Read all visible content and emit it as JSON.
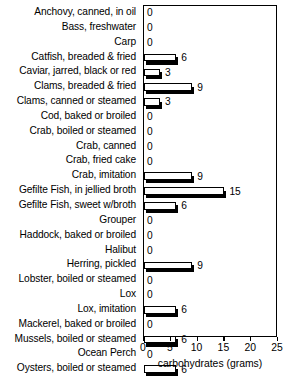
{
  "chart_data": {
    "type": "bar",
    "orientation": "horizontal",
    "title": "",
    "xlabel": "carbohydrates (grams)",
    "ylabel": "",
    "xlim": [
      0,
      25
    ],
    "xticks": [
      0,
      5,
      10,
      15,
      20,
      25
    ],
    "grid": false,
    "legend": null,
    "categories": [
      "Anchovy, canned, in oil",
      "Bass, freshwater",
      "Carp",
      "Catfish, breaded & fried",
      "Caviar, jarred, black or red",
      "Clams, breaded & fried",
      "Clams, canned or steamed",
      "Cod, baked or broiled",
      "Crab, boiled or steamed",
      "Crab, canned",
      "Crab, fried cake",
      "Crab, imitation",
      "Gefilte Fish, in jellied broth",
      "Gefilte Fish, sweet w/broth",
      "Grouper",
      "Haddock, baked or broiled",
      "Halibut",
      "Herring, pickled",
      "Lobster, boiled or steamed",
      "Lox",
      "Lox, imitation",
      "Mackerel, baked or broiled",
      "Mussels, boiled or steamed",
      "Ocean Perch",
      "Oysters, boiled or steamed"
    ],
    "values": [
      0,
      0,
      0,
      6,
      3,
      9,
      3,
      0,
      0,
      0,
      0,
      9,
      15,
      6,
      0,
      0,
      0,
      9,
      0,
      0,
      6,
      0,
      6,
      0,
      6
    ],
    "data_labels": [
      "0",
      "0",
      "0",
      "6",
      "3",
      "9",
      "3",
      "0",
      "0",
      "0",
      "0",
      "9",
      "15",
      "6",
      "0",
      "0",
      "0",
      "9",
      "0",
      "0",
      "6",
      "0",
      "6",
      "0",
      "6"
    ],
    "xtick_labels": [
      "0",
      "5",
      "10",
      "15",
      "20",
      "25"
    ],
    "colors": {
      "bar_fill": "#ffffff",
      "bar_outline": "#000000",
      "bar_shadow": "#000000",
      "axis": "#000000",
      "text": "#000000",
      "background": "#ffffff"
    }
  }
}
